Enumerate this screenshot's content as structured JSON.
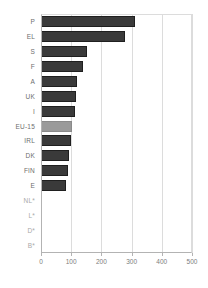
{
  "chart_data": {
    "type": "bar",
    "orientation": "horizontal",
    "title": "",
    "subtitle": "",
    "xlabel": "",
    "ylabel": "",
    "xlim": [
      0,
      500
    ],
    "xticks": [
      0,
      100,
      200,
      300,
      400,
      500
    ],
    "xtick_labels": [
      "0",
      "100",
      "200",
      "300",
      "400",
      "500"
    ],
    "grid": "vertical",
    "legend": "none",
    "categories": [
      "P",
      "EL",
      "S",
      "F",
      "A",
      "UK",
      "I",
      "EU-15",
      "IRL",
      "DK",
      "FIN",
      "E",
      "NL*",
      "L*",
      "D*",
      "B*"
    ],
    "values": [
      312,
      278,
      153,
      138,
      120,
      116,
      112,
      102,
      99,
      93,
      90,
      82,
      null,
      null,
      null,
      null
    ],
    "bars": [
      {
        "label": "P",
        "value": 312,
        "color": "#3a3a3a",
        "highlight": false,
        "missing": false
      },
      {
        "label": "EL",
        "value": 278,
        "color": "#3a3a3a",
        "highlight": false,
        "missing": false
      },
      {
        "label": "S",
        "value": 153,
        "color": "#3a3a3a",
        "highlight": false,
        "missing": false
      },
      {
        "label": "F",
        "value": 138,
        "color": "#3a3a3a",
        "highlight": false,
        "missing": false
      },
      {
        "label": "A",
        "value": 120,
        "color": "#3a3a3a",
        "highlight": false,
        "missing": false
      },
      {
        "label": "UK",
        "value": 116,
        "color": "#3a3a3a",
        "highlight": false,
        "missing": false
      },
      {
        "label": "I",
        "value": 112,
        "color": "#3a3a3a",
        "highlight": false,
        "missing": false
      },
      {
        "label": "EU-15",
        "value": 102,
        "color": "#9a9a9a",
        "highlight": true,
        "missing": false
      },
      {
        "label": "IRL",
        "value": 99,
        "color": "#3a3a3a",
        "highlight": false,
        "missing": false
      },
      {
        "label": "DK",
        "value": 93,
        "color": "#3a3a3a",
        "highlight": false,
        "missing": false
      },
      {
        "label": "FIN",
        "value": 90,
        "color": "#3a3a3a",
        "highlight": false,
        "missing": false
      },
      {
        "label": "E",
        "value": 82,
        "color": "#3a3a3a",
        "highlight": false,
        "missing": false
      },
      {
        "label": "NL*",
        "value": null,
        "color": "#3a3a3a",
        "highlight": false,
        "missing": true
      },
      {
        "label": "L*",
        "value": null,
        "color": "#3a3a3a",
        "highlight": false,
        "missing": true
      },
      {
        "label": "D*",
        "value": null,
        "color": "#3a3a3a",
        "highlight": false,
        "missing": true
      },
      {
        "label": "B*",
        "value": null,
        "color": "#3a3a3a",
        "highlight": false,
        "missing": true
      }
    ],
    "colors": {
      "bar": "#3a3a3a",
      "bar_highlight": "#9a9a9a",
      "grid": "#dcdcdc",
      "axis": "#b3b3b3",
      "tick_text": "#7d7d7d",
      "category_text": "#6e6e6e",
      "category_text_missing": "#a8a8a8",
      "background": "#ffffff"
    }
  }
}
